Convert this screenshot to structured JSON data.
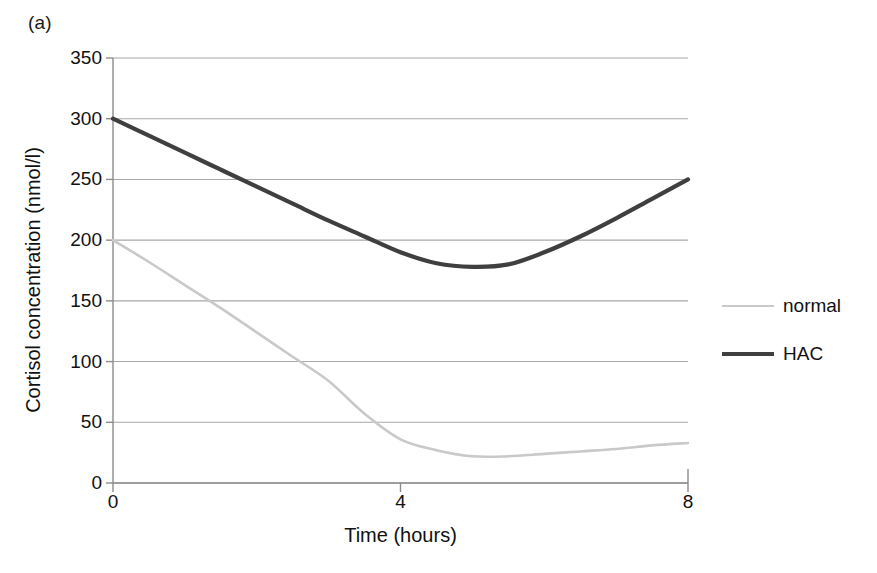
{
  "figure": {
    "panel_label": "(a)"
  },
  "chart_data": {
    "type": "line",
    "title": "",
    "panel": "(a)",
    "xlabel": "Time (hours)",
    "ylabel": "Cortisol concentration (nmol/l)",
    "xlim": [
      0,
      8
    ],
    "ylim": [
      0,
      350
    ],
    "xticks": [
      "0",
      "4",
      "8"
    ],
    "xtick_values": [
      0,
      4,
      8
    ],
    "yticks": [
      "0",
      "50",
      "100",
      "150",
      "200",
      "250",
      "300",
      "350"
    ],
    "ytick_values": [
      0,
      50,
      100,
      150,
      200,
      250,
      300,
      350
    ],
    "grid": "horizontal",
    "legend_position": "right",
    "x": [
      0,
      0.5,
      1,
      1.5,
      2,
      2.5,
      3,
      3.5,
      4,
      4.5,
      5,
      5.5,
      6,
      6.5,
      7,
      7.5,
      8
    ],
    "series": [
      {
        "name": "normal",
        "color": "#c9c9c9",
        "line_width": 2.6,
        "values": [
          200,
          182,
          163,
          144,
          124,
          104,
          84,
          57,
          36,
          27,
          22,
          22,
          24,
          26,
          28,
          31,
          33
        ]
      },
      {
        "name": "HAC",
        "color": "#3f3f3f",
        "line_width": 4.2,
        "values": [
          300,
          286,
          272,
          258,
          244,
          230,
          216,
          203,
          190,
          181,
          178,
          180,
          190,
          203,
          218,
          234,
          250
        ]
      }
    ],
    "annotations": [
      "normal curve falls from 200 nmol/l at 0 h to a nadir of about 22 nmol/l near 5 h, then rises slightly to about 33 nmol/l at 8 h",
      "HAC curve falls from 300 nmol/l at 0 h to a nadir of about 178 nmol/l near 5 h, then rises to 250 nmol/l at 8 h"
    ]
  },
  "legend": {
    "items": [
      {
        "label": "normal",
        "color": "#c9c9c9",
        "width": 2.6
      },
      {
        "label": "HAC",
        "color": "#3f3f3f",
        "width": 4.2
      }
    ]
  },
  "colors": {
    "normal": "#c9c9c9",
    "hac": "#3f3f3f",
    "grid": "#a8a8a8",
    "axis": "#8c8c8c",
    "text": "#111111",
    "background": "#ffffff"
  },
  "geometry": {
    "plot_left": 113,
    "plot_right": 688,
    "plot_top": 58,
    "plot_bottom": 483
  }
}
